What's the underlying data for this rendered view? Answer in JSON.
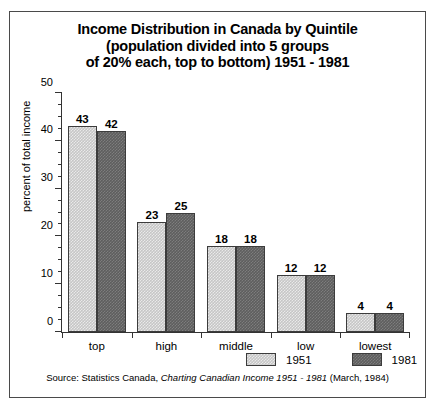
{
  "chart_data": {
    "type": "bar",
    "title": "Income Distribution in Canada by Quintile (population divided into 5 groups of 20% each, top to bottom) 1951 - 1981",
    "title_lines": [
      "Income Distribution in Canada by Quintile",
      "(population divided into 5 groups",
      "of 20% each, top to bottom) 1951 - 1981"
    ],
    "categories": [
      "top",
      "high",
      "middle",
      "low",
      "lowest"
    ],
    "series": [
      {
        "name": "1951",
        "values": [
          43,
          23,
          18,
          12,
          4
        ],
        "color": "#c6c6c6"
      },
      {
        "name": "1981",
        "values": [
          42,
          25,
          18,
          12,
          4
        ],
        "color": "#5e5e5e"
      }
    ],
    "xlabel": "",
    "ylabel": "percent of total income",
    "ylim": [
      0,
      50
    ],
    "ytick_values": [
      0,
      10,
      20,
      30,
      40,
      50
    ],
    "ytick_labels": [
      "0",
      "10",
      "20",
      "30",
      "40",
      "50"
    ],
    "yminor_step": 2.5,
    "grid": false,
    "legend_position": "bottom-right",
    "data_labels": true
  },
  "source": {
    "prefix": "Source:  Statistics Canada, ",
    "italic": "Charting Canadian Income 1951 - 1981",
    "suffix": "  (March, 1984)"
  },
  "legend": {
    "items": [
      {
        "label": "1951"
      },
      {
        "label": "1981"
      }
    ]
  },
  "colors": {
    "series_1951": "#c6c6c6",
    "series_1981": "#5e5e5e",
    "axis": "#333333",
    "frame": "#4a4a4a",
    "background": "#ffffff"
  }
}
